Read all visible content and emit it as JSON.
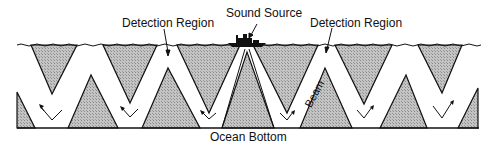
{
  "diagram": {
    "labels": {
      "sound_source": "Sound Source",
      "detection_region_left": "Detection Region",
      "detection_region_right": "Detection Region",
      "beam": "Beam",
      "ocean_bottom": "Ocean Bottom"
    },
    "colors": {
      "ink": "#111111",
      "hatch_fill": "#b9b9b9",
      "background": "#ffffff"
    },
    "elements": {
      "ship": "ship-icon",
      "surface": "wavy-sea-surface",
      "bottom": "ocean-bottom-line",
      "direction_markers": "arrow-icon"
    }
  }
}
